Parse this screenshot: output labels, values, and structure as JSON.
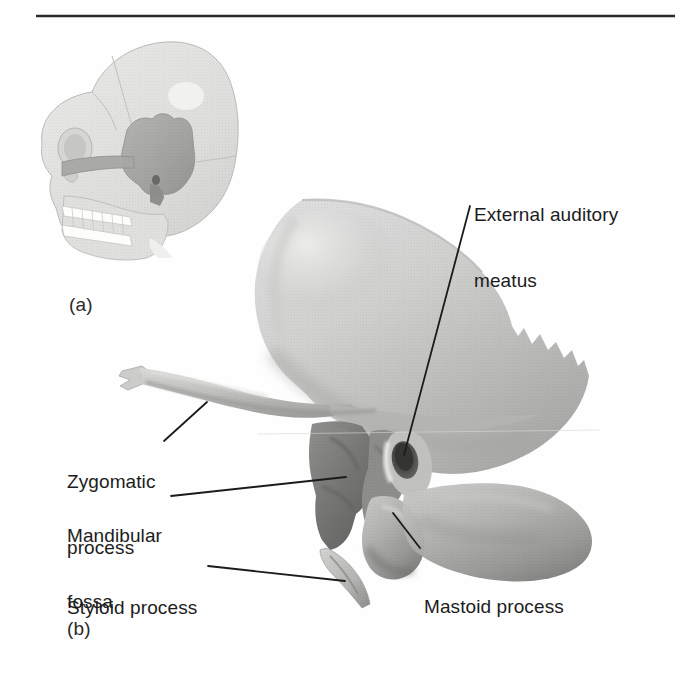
{
  "figure": {
    "type": "anatomical-illustration",
    "background_color": "#ffffff",
    "text_color": "#1c1c1c",
    "rule_color": "#2b2b2b",
    "panels": [
      {
        "letter": "(a)",
        "description": "lateral view of skull with temporal bone highlighted"
      },
      {
        "letter": "(b)",
        "description": "isolated left temporal bone, lateral view"
      }
    ],
    "labels": [
      {
        "id": "external-auditory-meatus",
        "text_line1": "External auditory",
        "text_line2": "meatus",
        "x": 474,
        "y": 160,
        "leader": {
          "x1": 470,
          "y1": 206,
          "x2": 404,
          "y2": 455
        }
      },
      {
        "id": "zygomatic-process",
        "text_line1": "Zygomatic",
        "text_line2": "process",
        "x": 67,
        "y": 427,
        "leader": {
          "x1": 164,
          "y1": 441,
          "x2": 207,
          "y2": 402
        }
      },
      {
        "id": "mandibular-fossa",
        "text_line1": "Mandibular",
        "text_line2": "fossa",
        "x": 67,
        "y": 481,
        "leader": {
          "x1": 171,
          "y1": 496,
          "x2": 346,
          "y2": 477
        }
      },
      {
        "id": "styloid-process",
        "text_line1": "Styloid process",
        "text_line2": "",
        "x": 67,
        "y": 553,
        "leader": {
          "x1": 208,
          "y1": 566,
          "x2": 345,
          "y2": 581
        }
      },
      {
        "id": "mastoid-process",
        "text_line1": "Mastoid process",
        "text_line2": "",
        "x": 424,
        "y": 552,
        "leader": {
          "x1": 420,
          "y1": 548,
          "x2": 393,
          "y2": 513
        }
      }
    ],
    "colors": {
      "bone_light": "#d9d9d7",
      "bone_mid": "#bdbdbb",
      "bone_shadow": "#9a9a99",
      "bone_dark": "#7c7c7b",
      "fossa_dark": "#6e6e6d",
      "meatus_hole": "#4a4a4a",
      "inset_bone": "#e2e2e0",
      "inset_highlight": "#a9a9a7",
      "outline": "#b0b0ae"
    }
  }
}
